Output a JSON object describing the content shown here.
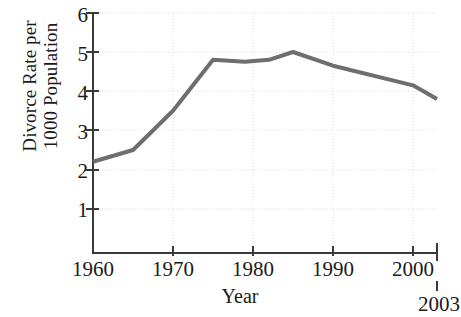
{
  "chart_data": {
    "type": "line",
    "title": "",
    "xlabel": "Year",
    "ylabel": "Divorce Rate per 1000 Population",
    "ylabel_lines": [
      "Divorce Rate per",
      "1000 Population"
    ],
    "xlim": [
      1960,
      2003
    ],
    "ylim": [
      0,
      6
    ],
    "grid": true,
    "legend": "none",
    "line_color": "#6e6e6e",
    "axis_color": "#3a3a3a",
    "grid_color": "#d8d8d8",
    "yticks": [
      1,
      2,
      3,
      4,
      5,
      6
    ],
    "ytick_labels": [
      "1",
      "2",
      "3",
      "4",
      "5",
      "6"
    ],
    "xticks": [
      1960,
      1970,
      1980,
      1990,
      2000
    ],
    "xtick_labels": [
      "1960",
      "1970",
      "1980",
      "1990",
      "2000"
    ],
    "end_tick": 2003,
    "end_tick_label": "2003",
    "x": [
      1960,
      1965,
      1970,
      1975,
      1979,
      1982,
      1985,
      1990,
      2000,
      2003
    ],
    "values": [
      2.2,
      2.5,
      3.5,
      4.8,
      4.75,
      4.8,
      5.0,
      4.65,
      4.15,
      3.8
    ],
    "series": [
      {
        "name": "Divorce Rate per 1000 Population",
        "values": [
          2.2,
          2.5,
          3.5,
          4.8,
          4.75,
          4.8,
          5.0,
          4.65,
          4.15,
          3.8
        ]
      }
    ]
  }
}
